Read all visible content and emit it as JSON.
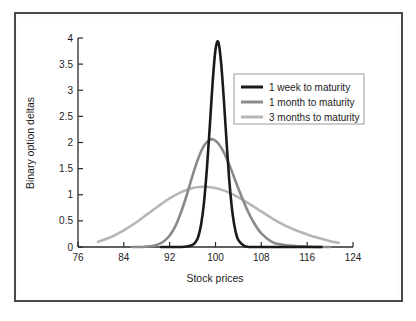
{
  "figure": {
    "frame_color": "#4a4a4a",
    "background": "#ffffff"
  },
  "chart_data": {
    "type": "line",
    "title": "",
    "xlabel": "Stock prices",
    "ylabel": "Binary option deltas",
    "xlim": [
      76,
      124
    ],
    "ylim": [
      0,
      4
    ],
    "xticks": [
      76,
      84,
      92,
      100,
      108,
      116,
      124
    ],
    "yticks": [
      0,
      0.5,
      1,
      1.5,
      2,
      2.5,
      3,
      3.5,
      4
    ],
    "xtick_labels": [
      "76",
      "84",
      "92",
      "100",
      "108",
      "116",
      "124"
    ],
    "ytick_labels": [
      "0",
      "0.5",
      "1",
      "1.5",
      "2",
      "2.5",
      "3",
      "3.5",
      "4"
    ],
    "grid": false,
    "legend_position": "upper right",
    "series": [
      {
        "name": "1 week to maturity",
        "color": "#1a1a1a",
        "linewidth": 2.6,
        "peak_x": 100,
        "peak_y": 3.92,
        "sigma": 1.42,
        "x_start": 90.5,
        "x_end": 118.5,
        "x": [
          90.5,
          92,
          93,
          94,
          95,
          96,
          96.5,
          97,
          97.5,
          98,
          98.5,
          99,
          99.5,
          100,
          100.5,
          101,
          101.5,
          102,
          102.5,
          103,
          103.5,
          104,
          105,
          106,
          107,
          108,
          110,
          114,
          118.5
        ],
        "y": [
          0.0,
          0.0,
          0.0,
          0.0,
          0.01,
          0.04,
          0.09,
          0.2,
          0.44,
          0.86,
          1.5,
          2.3,
          3.15,
          3.78,
          3.92,
          3.5,
          2.75,
          1.9,
          1.15,
          0.62,
          0.3,
          0.13,
          0.02,
          0.0,
          0.0,
          0.0,
          0.0,
          0.0,
          0.0
        ]
      },
      {
        "name": "1 month to maturity",
        "color": "#8a8a8a",
        "linewidth": 2.6,
        "peak_x": 99.6,
        "peak_y": 2.06,
        "sigma": 2.75,
        "x_start": 85.5,
        "x_end": 120.0,
        "x": [
          85.5,
          87,
          88,
          89,
          90,
          91,
          92,
          93,
          94,
          95,
          96,
          97,
          98,
          99,
          99.6,
          100.5,
          101.5,
          102.5,
          103.5,
          104.5,
          105.5,
          106.5,
          108,
          110,
          112,
          114,
          116,
          118,
          120
        ],
        "y": [
          0.0,
          0.0,
          0.01,
          0.02,
          0.05,
          0.11,
          0.22,
          0.4,
          0.67,
          1.0,
          1.37,
          1.7,
          1.94,
          2.05,
          2.06,
          1.98,
          1.8,
          1.55,
          1.26,
          0.98,
          0.72,
          0.5,
          0.26,
          0.09,
          0.04,
          0.02,
          0.01,
          0.0,
          0.0
        ]
      },
      {
        "name": "3 months to maturity",
        "color": "#b6b6b6",
        "linewidth": 2.6,
        "peak_x": 98.5,
        "peak_y": 1.15,
        "sigma": 5.1,
        "x_start": 79.5,
        "x_end": 121.5,
        "x": [
          79.5,
          82,
          84,
          86,
          88,
          90,
          92,
          94,
          96,
          97.5,
          98.5,
          100,
          102,
          104,
          106,
          108,
          110,
          112,
          114,
          116,
          118,
          120,
          121.5
        ],
        "y": [
          0.1,
          0.2,
          0.32,
          0.46,
          0.62,
          0.78,
          0.93,
          1.05,
          1.13,
          1.15,
          1.15,
          1.13,
          1.06,
          0.95,
          0.82,
          0.68,
          0.54,
          0.42,
          0.32,
          0.24,
          0.17,
          0.11,
          0.08
        ]
      }
    ],
    "legend_entries": [
      {
        "label": "1 week to maturity",
        "color": "#1a1a1a"
      },
      {
        "label": "1 month to maturity",
        "color": "#8a8a8a"
      },
      {
        "label": "3 months to maturity",
        "color": "#b6b6b6"
      }
    ]
  }
}
